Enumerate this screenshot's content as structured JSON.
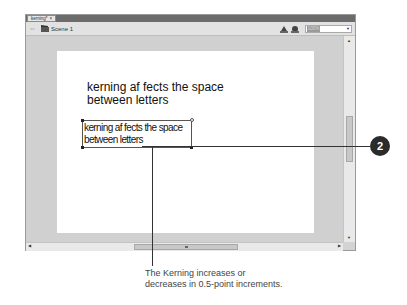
{
  "window": {
    "tab": {
      "label": "kerning*",
      "close": "×"
    },
    "scenebar": {
      "back": "⇦",
      "scene_label": "Scene 1",
      "zoom_value": "100%",
      "zoom_arrow": "▼"
    }
  },
  "stage": {
    "static_text": {
      "line1": "kerning af  fects the space",
      "line2": "between letters"
    },
    "editing_text": {
      "line1": "kerning af  fects the space",
      "line2": "between letters"
    }
  },
  "scrollbars": {
    "up": "▲",
    "down": "▼",
    "left": "◀",
    "right": "▶"
  },
  "callout": {
    "number": "2",
    "caption_line1": "The Kerning increases or",
    "caption_line2": "decreases in 0.5-point increments."
  },
  "colors": {
    "pasteboard": "#d0d0d0",
    "tabstrip": "#6b6b6b",
    "badge": "#2b2b2b"
  }
}
